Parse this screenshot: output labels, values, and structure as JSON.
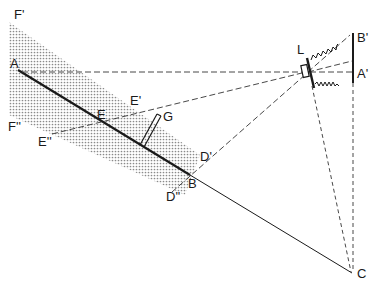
{
  "diagram": {
    "labels": {
      "A": "A",
      "B": "B",
      "C": "C",
      "E": "E",
      "E_prime": "E'",
      "E_double_prime": "E''",
      "F_prime": "F'",
      "F_double_prime": "F''",
      "D_prime": "D'",
      "D_double_prime": "D''",
      "G": "G",
      "L": "L",
      "A_prime": "A'",
      "B_prime": "B'"
    },
    "colors": {
      "line": "#1a1a1a",
      "shade": "#9a9a9a",
      "background": "#ffffff"
    }
  }
}
